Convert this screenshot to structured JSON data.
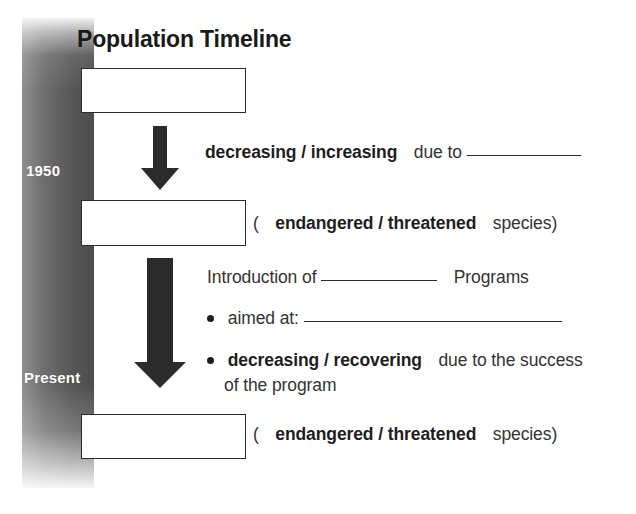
{
  "title": {
    "light": "Population",
    "heavy": "Timeline"
  },
  "timeline": {
    "labels": [
      {
        "id": "past",
        "text": "1950"
      },
      {
        "id": "present",
        "text": "Present"
      }
    ],
    "bar_colors": {
      "light": "#8f8f8f",
      "dark": "#4e4e4e"
    }
  },
  "boxes": [
    {
      "id": "box-1",
      "value": ""
    },
    {
      "id": "box-2",
      "value": ""
    },
    {
      "id": "box-3",
      "value": ""
    }
  ],
  "arrows": [
    {
      "id": "arrow-1",
      "direction": "down",
      "color": "#2b2b2b"
    },
    {
      "id": "arrow-2",
      "direction": "down",
      "color": "#2b2b2b"
    }
  ],
  "rows": {
    "decreasing": {
      "choice_a": "decreasing",
      "slash": "/",
      "choice_b": "increasing",
      "tail": "due to"
    },
    "paren_1": {
      "open": "(",
      "choice_a": "endangered",
      "slash": "/",
      "choice_b": "threatened",
      "close": "species)"
    },
    "intro": {
      "lead": "Introduction of",
      "tail": "Programs"
    },
    "aimed": {
      "label": "aimed at:"
    },
    "bullet2": {
      "choice_a": "decreasing",
      "slash": "/",
      "choice_b": "recovering",
      "tail": "due to the success",
      "line2": "of the program"
    },
    "paren_2": {
      "open": "(",
      "choice_a": "endangered",
      "slash": "/",
      "choice_b": "threatened",
      "close": "species)"
    }
  }
}
